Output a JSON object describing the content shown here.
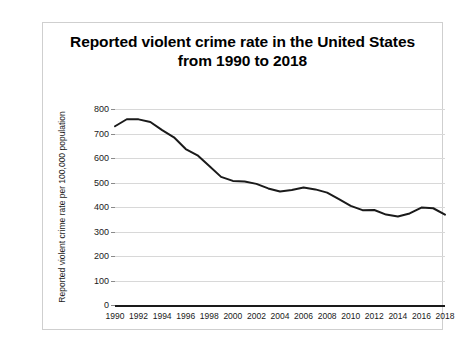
{
  "figure": {
    "title_line_1": "Reported violent crime rate in the United States",
    "title_line_2": "from 1990 to 2018",
    "ylabel": "Reported violent crime rate per 100,000 population",
    "line_color": "#1a1a1a",
    "grid_color": "#d8d8d8",
    "axis_color": "#1a1a1a",
    "border_color": "#cfcfcf",
    "background": "#ffffff"
  },
  "chart_data": {
    "type": "line",
    "title": "Reported violent crime rate in the United States from 1990 to 2018",
    "xlabel": "",
    "ylabel": "Reported violent crime rate per 100,000 population",
    "ylim": [
      0,
      800
    ],
    "xlim": [
      1990,
      2018
    ],
    "grid": true,
    "legend": "none",
    "yticks": [
      0,
      100,
      200,
      300,
      400,
      500,
      600,
      700,
      800
    ],
    "ytick_labels": [
      "0",
      "100",
      "200",
      "300",
      "400",
      "500",
      "600",
      "700",
      "800"
    ],
    "xticks": [
      1990,
      1992,
      1994,
      1996,
      1998,
      2000,
      2002,
      2004,
      2006,
      2008,
      2010,
      2012,
      2014,
      2016,
      2018
    ],
    "xtick_labels": [
      "1990",
      "1992",
      "1994",
      "1996",
      "1998",
      "2000",
      "2002",
      "2004",
      "2006",
      "2008",
      "2010",
      "2012",
      "2014",
      "2016",
      "2018"
    ],
    "x": [
      1990,
      1991,
      1992,
      1993,
      1994,
      1995,
      1996,
      1997,
      1998,
      1999,
      2000,
      2001,
      2002,
      2003,
      2004,
      2005,
      2006,
      2007,
      2008,
      2009,
      2010,
      2011,
      2012,
      2013,
      2014,
      2015,
      2016,
      2017,
      2018
    ],
    "values": [
      729.6,
      758.2,
      757.7,
      747.1,
      713.6,
      684.5,
      636.6,
      611.0,
      567.6,
      523.0,
      506.5,
      504.5,
      494.4,
      475.8,
      463.2,
      469.0,
      479.3,
      471.8,
      458.6,
      431.9,
      404.5,
      387.1,
      387.8,
      369.1,
      361.6,
      373.7,
      397.5,
      394.9,
      368.9
    ]
  }
}
